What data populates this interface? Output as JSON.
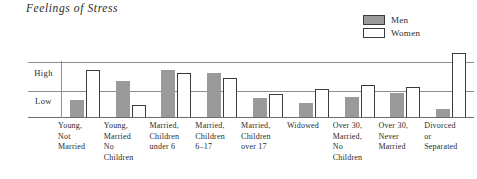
{
  "chart": {
    "title": "Feelings of Stress",
    "legend": [
      {
        "label": "Men",
        "key": "men",
        "color": "#9a9a9a",
        "style": "filled"
      },
      {
        "label": "Women",
        "key": "women",
        "color": "#ffffff",
        "style": "outlined"
      }
    ],
    "y_ticks": [
      {
        "label": "High"
      },
      {
        "label": "Low"
      }
    ]
  },
  "chart_data": {
    "type": "bar",
    "title": "Feelings of Stress",
    "xlabel": "",
    "ylabel": "",
    "ylim": [
      0,
      3
    ],
    "grid": true,
    "legend_position": "top-right",
    "ytick_labels": [
      "Low",
      "High"
    ],
    "ytick_values": [
      1,
      2
    ],
    "categories": [
      "Young, Not Married",
      "Young, Married No Children",
      "Married, Children under 6",
      "Married, Children 6–17",
      "Married, Children over 17",
      "Widowed",
      "Over 30, Married, No Children",
      "Over 30, Never Married",
      "Divorced or Separated"
    ],
    "category_lines": [
      [
        "Young,",
        "Not",
        "Married"
      ],
      [
        "Young,",
        "Married",
        "No",
        "Children"
      ],
      [
        "Married,",
        "Children",
        "under 6"
      ],
      [
        "Married,",
        "Children",
        "6–17"
      ],
      [
        "Married,",
        "Children",
        "over 17"
      ],
      [
        "Widowed"
      ],
      [
        "Over 30,",
        "Married,",
        "No",
        "Children"
      ],
      [
        "Over 30,",
        "Never",
        "Married"
      ],
      [
        "Divorced",
        "or",
        "Separated"
      ]
    ],
    "series": [
      {
        "name": "Men",
        "color": "#9a9a9a",
        "values": [
          0.63,
          1.32,
          1.74,
          1.62,
          0.7,
          0.52,
          0.74,
          0.9,
          0.3
        ]
      },
      {
        "name": "Women",
        "color": "#ffffff",
        "values": [
          1.74,
          0.46,
          1.62,
          1.44,
          0.86,
          1.02,
          1.18,
          1.12,
          2.38
        ]
      }
    ]
  }
}
